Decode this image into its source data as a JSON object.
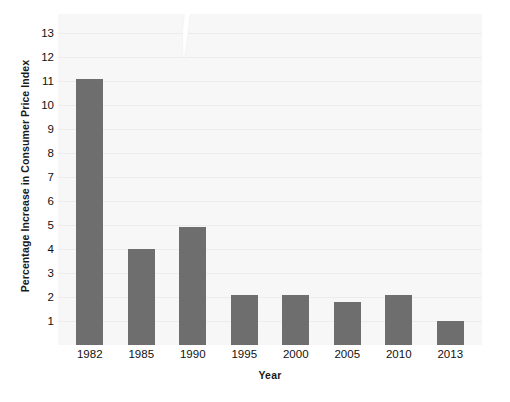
{
  "chart_data": {
    "type": "bar",
    "title": "",
    "subtitle": "",
    "xlabel": "Year",
    "ylabel": "Percentage Increase in Consumer Price Index",
    "categories": [
      "1982",
      "1985",
      "1990",
      "1995",
      "2000",
      "2005",
      "2010",
      "2013"
    ],
    "values": [
      11.1,
      4.0,
      4.9,
      2.1,
      2.1,
      1.8,
      2.1,
      1.0
    ],
    "series": [
      {
        "name": "Percentage Increase in Consumer Price Index",
        "values": [
          11.1,
          4.0,
          4.9,
          2.1,
          2.1,
          1.8,
          2.1,
          1.0
        ]
      }
    ],
    "ytick_labels": [
      "13",
      "12",
      "11",
      "10",
      "9",
      "8",
      "7",
      "6",
      "5",
      "4",
      "3",
      "2",
      "1"
    ],
    "ytick_values": [
      13,
      12,
      11,
      10,
      9,
      8,
      7,
      6,
      5,
      4,
      3,
      2,
      1
    ],
    "ylim": [
      0,
      13.8
    ],
    "xlim_categories": 8,
    "grid": true,
    "grid_axis": "y",
    "legend": false,
    "legend_position": "none",
    "bar_color": "#6e6e6e",
    "plot_background": "#f7f7f7",
    "page_background": "#ffffff",
    "gridline_color": "#ececec",
    "text_color": "#111111",
    "annotations": []
  }
}
